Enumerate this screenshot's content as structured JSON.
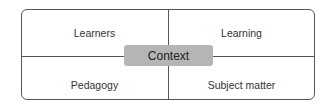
{
  "diagram": {
    "quadrants": {
      "top_left": "Learners",
      "top_right": "Learning",
      "bottom_left": "Pedagogy",
      "bottom_right": "Subject matter"
    },
    "center": "Context",
    "colors": {
      "border": "#555555",
      "center_fill": "#b5b5b5",
      "text": "#333333"
    }
  }
}
